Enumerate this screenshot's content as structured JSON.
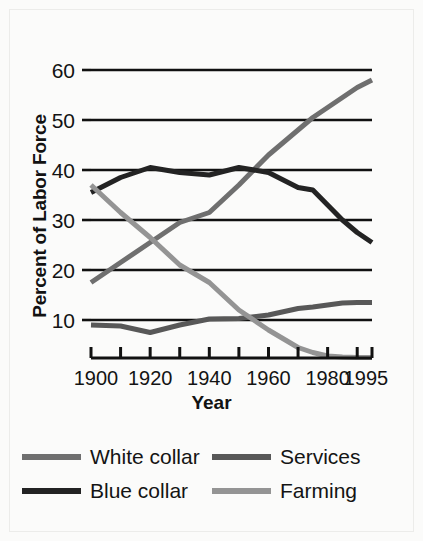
{
  "chart_data": {
    "type": "line",
    "title": "",
    "xlabel": "Year",
    "ylabel": "Percent of Labor Force",
    "xlim": [
      1900,
      1995
    ],
    "ylim": [
      0,
      62
    ],
    "grid": true,
    "legend_position": "below",
    "y_ticks": [
      60,
      50,
      40,
      30,
      20,
      10
    ],
    "y_tick_labels": [
      "60",
      "50",
      "40",
      "30",
      "20",
      "10"
    ],
    "x_ticks": [
      1900,
      1910,
      1920,
      1930,
      1940,
      1950,
      1960,
      1970,
      1980,
      1990,
      1995
    ],
    "x_tick_labels_shown": [
      "1900",
      "1920",
      "1940",
      "1960",
      "1980",
      "1995"
    ],
    "x_tick_label_values": [
      1900,
      1920,
      1940,
      1960,
      1980,
      1995
    ],
    "x": [
      1900,
      1910,
      1920,
      1930,
      1940,
      1950,
      1960,
      1970,
      1975,
      1980,
      1985,
      1990,
      1995
    ],
    "series": [
      {
        "name": "White collar",
        "color": "#6f6f6f",
        "values": [
          17.5,
          21.5,
          25.5,
          29.5,
          31.5,
          37.0,
          43.0,
          48.0,
          50.5,
          52.5,
          54.5,
          56.5,
          58.0
        ]
      },
      {
        "name": "Blue collar",
        "color": "#232323",
        "values": [
          35.5,
          38.5,
          40.5,
          39.5,
          39.0,
          40.5,
          39.5,
          36.5,
          36.0,
          33.0,
          30.0,
          27.5,
          25.5
        ]
      },
      {
        "name": "Services",
        "color": "#585858",
        "values": [
          9.0,
          8.8,
          7.5,
          9.0,
          10.2,
          10.3,
          11.0,
          12.3,
          12.6,
          13.0,
          13.4,
          13.5,
          13.5
        ]
      },
      {
        "name": "Farming",
        "color": "#949494",
        "values": [
          37.0,
          31.5,
          26.5,
          21.0,
          17.5,
          12.0,
          8.0,
          4.5,
          3.5,
          2.8,
          2.6,
          2.5,
          2.5
        ]
      }
    ]
  },
  "legend": {
    "items": [
      {
        "label": "White collar",
        "color": "#6f6f6f"
      },
      {
        "label": "Services",
        "color": "#585858"
      },
      {
        "label": "Blue collar",
        "color": "#232323"
      },
      {
        "label": "Farming",
        "color": "#949494"
      }
    ]
  },
  "axis": {
    "x_title": "Year",
    "y_title": "Percent of Labor Force"
  },
  "colors": {
    "background": "#fbfbfa",
    "axis": "#111111",
    "grid": "#111111",
    "white_collar": "#6f6f6f",
    "blue_collar": "#232323",
    "services": "#585858",
    "farming": "#949494"
  }
}
